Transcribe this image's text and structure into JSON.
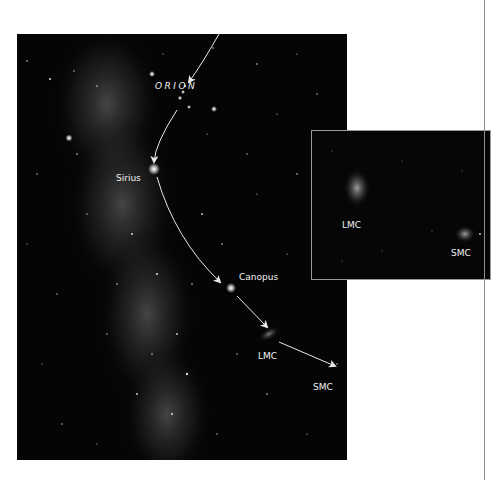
{
  "figure": {
    "main_photo": {
      "description": "Southern sky with Milky Way, star-hopping path from Orion to Magellanic Clouds",
      "labels": {
        "orion": "ORION",
        "sirius": "Sirius",
        "canopus": "Canopus",
        "lmc": "LMC",
        "smc": "SMC"
      }
    },
    "inset_photo": {
      "description": "Close-up of the Large and Small Magellanic Clouds",
      "labels": {
        "lmc": "LMC",
        "smc": "SMC"
      }
    },
    "colors": {
      "sky": "#050505",
      "label": "#f2f2f2",
      "arrow": "#e8e8e8",
      "inset_border": "#9a9a9a",
      "page_rule": "#8c8c8c"
    }
  }
}
